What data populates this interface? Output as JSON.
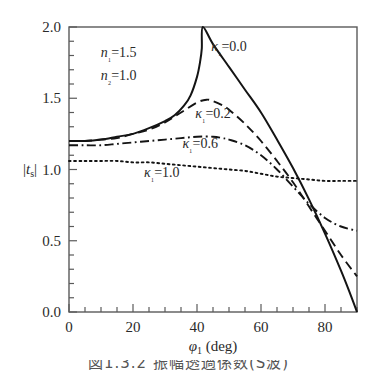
{
  "figure": {
    "caption": "図1.3.2 振幅透過係数(S波)"
  },
  "chart_data": {
    "type": "line",
    "title": "",
    "xlabel": "φ₁ (deg)",
    "ylabel": "|t_s|",
    "xlim": [
      0,
      90
    ],
    "ylim": [
      0,
      2.0
    ],
    "grid": false,
    "legend_position": "inline-annotations",
    "x_ticks": [
      0,
      20,
      40,
      60,
      80
    ],
    "x_tick_labels": [
      "0",
      "20",
      "40",
      "60",
      "80"
    ],
    "x_minor_tick_step": 5,
    "y_ticks": [
      0.0,
      0.5,
      1.0,
      1.5,
      2.0
    ],
    "y_tick_labels": [
      "0.0",
      "0.5",
      "1.0",
      "1.5",
      "2.0"
    ],
    "y_minor_tick_step": 0.1,
    "parameters": {
      "n1_label": "n₁=1.5",
      "n1_value": 1.5,
      "n2_label": "n₂=1.0",
      "n2_value": 1.0,
      "critical_angle_deg": 41.8
    },
    "series": [
      {
        "name": "κ₁=0.0",
        "kappa": 0.0,
        "style": "solid",
        "label": "κ₁=0.0",
        "x": [
          0,
          5,
          10,
          15,
          20,
          25,
          30,
          33,
          36,
          38,
          40,
          41,
          41.5,
          41.8,
          45,
          50,
          55,
          60,
          65,
          70,
          75,
          80,
          85,
          88,
          90
        ],
        "y": [
          1.2,
          1.2,
          1.21,
          1.23,
          1.25,
          1.29,
          1.34,
          1.38,
          1.45,
          1.52,
          1.65,
          1.76,
          1.85,
          2.0,
          1.88,
          1.72,
          1.56,
          1.4,
          1.21,
          1.01,
          0.79,
          0.55,
          0.29,
          0.12,
          0.0
        ]
      },
      {
        "name": "κ₁=0.2",
        "kappa": 0.2,
        "style": "dashed",
        "label": "κ₁=0.2",
        "x": [
          0,
          5,
          10,
          15,
          20,
          25,
          30,
          35,
          40,
          43,
          45,
          48,
          50,
          55,
          60,
          65,
          70,
          75,
          80,
          85,
          90
        ],
        "y": [
          1.2,
          1.2,
          1.21,
          1.22,
          1.25,
          1.28,
          1.33,
          1.4,
          1.47,
          1.49,
          1.48,
          1.45,
          1.42,
          1.32,
          1.2,
          1.06,
          0.91,
          0.74,
          0.57,
          0.4,
          0.25
        ]
      },
      {
        "name": "κ₁=0.6",
        "kappa": 0.6,
        "style": "dash-dot",
        "label": "κ₁=0.6",
        "x": [
          0,
          5,
          10,
          15,
          20,
          25,
          30,
          35,
          40,
          45,
          48,
          50,
          55,
          60,
          65,
          70,
          75,
          80,
          85,
          90
        ],
        "y": [
          1.17,
          1.17,
          1.17,
          1.18,
          1.19,
          1.2,
          1.21,
          1.22,
          1.23,
          1.23,
          1.22,
          1.21,
          1.17,
          1.1,
          1.0,
          0.88,
          0.76,
          0.66,
          0.6,
          0.57
        ]
      },
      {
        "name": "κ₁=1.0",
        "kappa": 1.0,
        "style": "dotted",
        "label": "κ₁=1.0",
        "x": [
          0,
          5,
          10,
          15,
          20,
          25,
          30,
          35,
          40,
          45,
          50,
          55,
          60,
          65,
          70,
          75,
          80,
          85,
          90
        ],
        "y": [
          1.06,
          1.06,
          1.06,
          1.06,
          1.05,
          1.05,
          1.04,
          1.03,
          1.02,
          1.01,
          1.0,
          0.99,
          0.97,
          0.95,
          0.94,
          0.93,
          0.92,
          0.92,
          0.92
        ]
      }
    ],
    "annotations": [
      {
        "id": "param-n1",
        "text": "n₁=1.5",
        "x_deg": 15.5,
        "y_val": 1.79
      },
      {
        "id": "param-n2",
        "text": "n₂=1.0",
        "x_deg": 15.5,
        "y_val": 1.63
      },
      {
        "id": "label-k0",
        "text": "κ₁=0.0",
        "x_deg": 50.0,
        "y_val": 1.83
      },
      {
        "id": "label-k02",
        "text": "κ₁=0.2",
        "x_deg": 45.0,
        "y_val": 1.36
      },
      {
        "id": "label-k06",
        "text": "κ₁=0.6",
        "x_deg": 41.0,
        "y_val": 1.15
      },
      {
        "id": "label-k10",
        "text": "κ₁=1.0",
        "x_deg": 29.0,
        "y_val": 0.95
      }
    ]
  }
}
